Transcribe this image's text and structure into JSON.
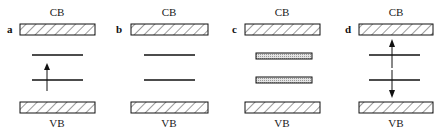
{
  "figure": {
    "panels": [
      {
        "id": "a",
        "label": "a",
        "cb_label": "CB",
        "vb_label": "VB",
        "levels": 2,
        "level_style": "line",
        "arrows": [
          {
            "direction": "up",
            "from": "lower-level",
            "to": "upper-level"
          }
        ]
      },
      {
        "id": "b",
        "label": "b",
        "cb_label": "CB",
        "vb_label": "VB",
        "levels": 2,
        "level_style": "line",
        "arrows": []
      },
      {
        "id": "c",
        "label": "c",
        "cb_label": "CB",
        "vb_label": "VB",
        "levels": 2,
        "level_style": "band",
        "arrows": []
      },
      {
        "id": "d",
        "label": "d",
        "cb_label": "CB",
        "vb_label": "VB",
        "levels": 2,
        "level_style": "line",
        "arrows": [
          {
            "direction": "up",
            "from": "upper-level",
            "to": "CB"
          },
          {
            "direction": "down",
            "from": "lower-level",
            "to": "VB"
          }
        ]
      }
    ],
    "colors": {
      "ink": "#111111",
      "hatch_bg": "#ffffff",
      "stipple": "#c8c8c8"
    }
  }
}
